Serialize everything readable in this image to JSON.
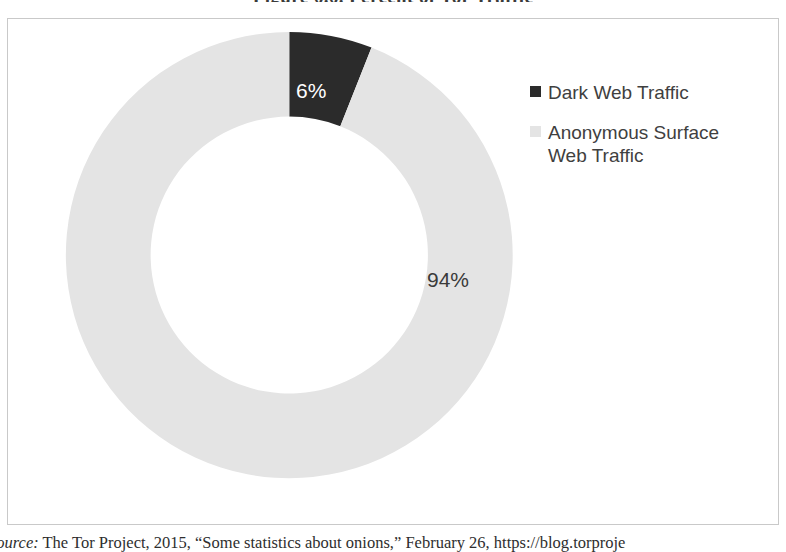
{
  "figure": {
    "title": "Figure 6.6. Percent of Tor Traffic",
    "source_prefix": "Source:",
    "source_text": "The Tor Project, 2015, “Some statistics about onions,” February 26, https://blog.torproje"
  },
  "legend": {
    "items": [
      {
        "label": "Dark Web Traffic",
        "color": "#2b2b2b",
        "marker": "square-marker"
      },
      {
        "label": "Anonymous Surface Web Traffic",
        "color": "#e4e4e4",
        "marker": "square-marker"
      }
    ]
  },
  "labels": {
    "dark": "6%",
    "light": "94%"
  },
  "chart_data": {
    "type": "pie",
    "variant": "doughnut",
    "title": "Figure 6.6. Percent of Tor Traffic",
    "categories": [
      "Dark Web Traffic",
      "Anonymous Surface Web Traffic"
    ],
    "values": [
      6,
      94
    ],
    "value_labels": [
      "6%",
      "94%"
    ],
    "unit": "percent",
    "colors": [
      "#2b2b2b",
      "#e4e4e4"
    ],
    "start_angle_deg": 0,
    "direction": "clockwise",
    "hole_ratio": 0.62,
    "legend": "right",
    "grid": false,
    "xlabel": "",
    "ylabel": ""
  },
  "geometry": {
    "center_x": 282,
    "center_y": 237,
    "outer_radius": 224,
    "inner_radius": 139
  }
}
